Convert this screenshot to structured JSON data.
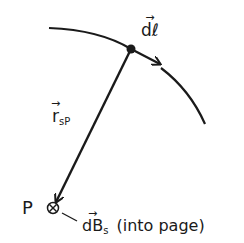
{
  "diagram": {
    "labels": {
      "dl": "dℓ",
      "r_main": "r",
      "r_sub": "sP",
      "point": "P",
      "dB_main": "dB",
      "dB_sub": "s",
      "dB_note": "(into page)"
    },
    "elements": {
      "wire": "curved wire carrying current",
      "source_point": "current element location (dot)",
      "dl_vector": "arrow tangent to wire at source point",
      "r_vector": "arrow from source point to P",
      "field_point": "P with into-page symbol ⊗"
    },
    "colors": {
      "ink": "#1a1a1a",
      "background": "#ffffff"
    }
  }
}
